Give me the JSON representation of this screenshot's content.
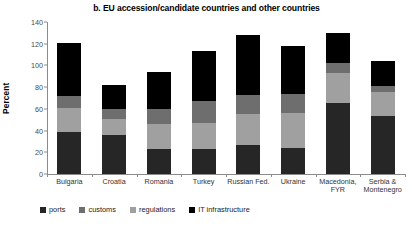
{
  "chart_data": {
    "type": "bar",
    "title": "b. EU accession/candidate countries and other countries",
    "xlabel": "",
    "ylabel": "Percent",
    "ylim": [
      0,
      140
    ],
    "yticks": [
      0,
      20,
      40,
      60,
      80,
      100,
      120,
      140
    ],
    "grid": false,
    "stacked": true,
    "legend_position": "bottom-left",
    "categories": [
      "Bulgaria",
      "Croatia",
      "Romania",
      "Turkey",
      "Russian Fed.",
      "Ukraine",
      "Macedonia, FYR",
      "Serbia & Montenegro"
    ],
    "category_lines": [
      [
        "Bulgaria"
      ],
      [
        "Croatia"
      ],
      [
        "Romania"
      ],
      [
        "Turkey"
      ],
      [
        "Russian Fed."
      ],
      [
        "Ukraine"
      ],
      [
        "Macedonia,",
        "FYR"
      ],
      [
        "Serbia &",
        "Montenegro"
      ]
    ],
    "series": [
      {
        "name": "ports",
        "color": "#262626",
        "values": [
          39,
          36,
          23,
          23,
          27,
          24,
          65,
          53
        ]
      },
      {
        "name": "regulations",
        "color": "#a0a0a0",
        "values": [
          22,
          15,
          23,
          24,
          28,
          32,
          28,
          23
        ]
      },
      {
        "name": "customs",
        "color": "#6e6e6e",
        "values": [
          11,
          9,
          14,
          20,
          18,
          18,
          9,
          5
        ]
      },
      {
        "name": "IT infrastructure",
        "color": "#000000",
        "values": [
          49,
          22,
          34,
          46,
          55,
          44,
          28,
          23
        ]
      }
    ],
    "stack_order": [
      "ports",
      "regulations",
      "customs",
      "IT infrastructure"
    ],
    "totals": [
      121,
      82,
      94,
      113,
      128,
      118,
      130,
      104
    ]
  },
  "legend": {
    "items": [
      {
        "label": "ports",
        "color": "#262626"
      },
      {
        "label": "customs",
        "color": "#6e6e6e"
      },
      {
        "label": "regulations",
        "color": "#a0a0a0"
      },
      {
        "label": "IT infrastructure",
        "color": "#000000"
      }
    ]
  }
}
